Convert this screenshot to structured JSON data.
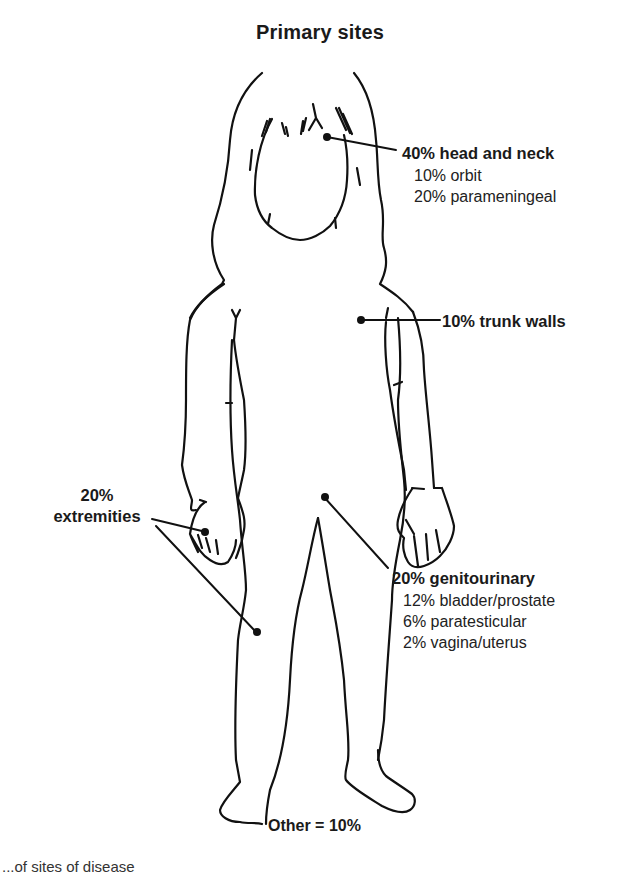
{
  "title": "Primary sites",
  "sites": {
    "head_neck": {
      "label": "40% head and neck",
      "percent": 40,
      "subsites": [
        {
          "label": "10% orbit",
          "percent": 10
        },
        {
          "label": "20% parameningeal",
          "percent": 20
        }
      ]
    },
    "trunk": {
      "label": "10% trunk walls",
      "percent": 10
    },
    "extremities": {
      "label_line1": "20%",
      "label_line2": "extremities",
      "percent": 20
    },
    "genitourinary": {
      "label": "20% genitourinary",
      "percent": 20,
      "subsites": [
        {
          "label": "12% bladder/prostate",
          "percent": 12
        },
        {
          "label": "6% paratesticular",
          "percent": 6
        },
        {
          "label": "2% vagina/uterus",
          "percent": 2
        }
      ]
    },
    "other": {
      "label": "Other = 10%",
      "percent": 10
    }
  },
  "caption_clipped": "...of sites of disease",
  "colors": {
    "line": "#111111",
    "text": "#1a1a1a",
    "background": "#ffffff"
  }
}
